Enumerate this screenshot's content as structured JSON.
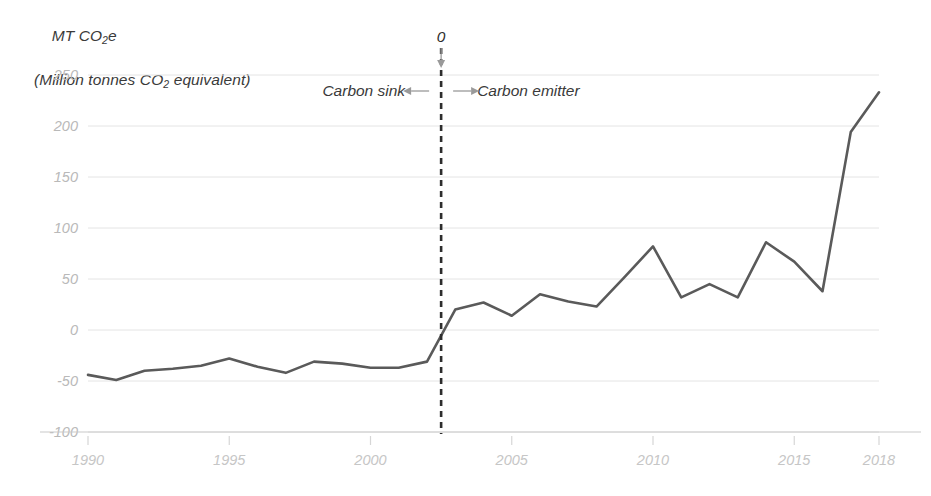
{
  "chart_data": {
    "type": "line",
    "title": "",
    "ylabel_line1": "MT CO2e",
    "ylabel_line2": "(Million tonnes CO2 equivalent)",
    "xlabel": "",
    "ylim": [
      -100,
      250
    ],
    "xlim": [
      1990,
      2018
    ],
    "grid": true,
    "legend": "none",
    "ytick_labels": [
      "250",
      "200",
      "150",
      "100",
      "50",
      "0",
      "-50",
      "-100"
    ],
    "yticks": [
      250,
      200,
      150,
      100,
      50,
      0,
      -50,
      -100
    ],
    "xtick_labels": [
      "1990",
      "1995",
      "2000",
      "2005",
      "2010",
      "2015",
      "2018"
    ],
    "xticks": [
      1990,
      1995,
      2000,
      2005,
      2010,
      2015,
      2018
    ],
    "x": [
      1990,
      1991,
      1992,
      1993,
      1994,
      1995,
      1996,
      1997,
      1998,
      1999,
      2000,
      2001,
      2002,
      2003,
      2004,
      2005,
      2006,
      2007,
      2008,
      2009,
      2010,
      2011,
      2012,
      2013,
      2014,
      2015,
      2016,
      2017,
      2018
    ],
    "values": [
      -44,
      -49,
      -40,
      -38,
      -35,
      -28,
      -36,
      -42,
      -31,
      -33,
      -37,
      -37,
      -31,
      20,
      27,
      14,
      35,
      28,
      23,
      52,
      82,
      32,
      45,
      32,
      86,
      67,
      38,
      194,
      233
    ],
    "series": [
      {
        "name": "Net greenhouse gas balance",
        "values": [
          -44,
          -49,
          -40,
          -38,
          -35,
          -28,
          -36,
          -42,
          -31,
          -33,
          -37,
          -37,
          -31,
          20,
          27,
          14,
          35,
          28,
          23,
          52,
          82,
          32,
          45,
          32,
          86,
          67,
          38,
          194,
          233
        ],
        "color": "#5a5a5a"
      }
    ],
    "annotations": [
      {
        "name": "zero-crossing-label",
        "text": "0",
        "x": 2002.5,
        "y": 250
      },
      {
        "name": "carbon-sink-label",
        "text": "Carbon sink",
        "x": 1999,
        "y": 232
      },
      {
        "name": "carbon-emitter-label",
        "text": "Carbon emitter",
        "x": 2006,
        "y": 232
      }
    ],
    "reference_line": {
      "name": "zero-crossing-line",
      "x": 2002.5,
      "style": "dashed",
      "color": "#2d2d2d"
    }
  }
}
